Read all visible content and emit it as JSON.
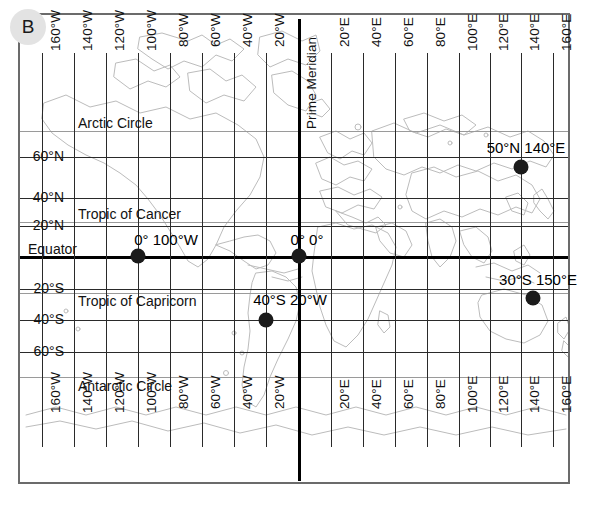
{
  "panel": {
    "badge_label": "B"
  },
  "map": {
    "projection_frame": {
      "left": 18,
      "top": 13,
      "width": 552,
      "height": 471
    },
    "longitude_labels": [
      {
        "label": "160°W",
        "x": 40
      },
      {
        "label": "140°W",
        "x": 72
      },
      {
        "label": "120°W",
        "x": 104
      },
      {
        "label": "100°W",
        "x": 136
      },
      {
        "label": "80°W",
        "x": 168
      },
      {
        "label": "60°W",
        "x": 200
      },
      {
        "label": "40°W",
        "x": 232
      },
      {
        "label": "20°W",
        "x": 264
      },
      {
        "label": "Prime Meridian",
        "x": 297,
        "emphasis": true
      },
      {
        "label": "20°E",
        "x": 329
      },
      {
        "label": "40°E",
        "x": 361
      },
      {
        "label": "60°E",
        "x": 393
      },
      {
        "label": "80°E",
        "x": 425
      },
      {
        "label": "100°E",
        "x": 457
      },
      {
        "label": "120°E",
        "x": 488
      },
      {
        "label": "140°E",
        "x": 519
      },
      {
        "label": "160°E",
        "x": 551
      }
    ],
    "bottom_longitude_labels": [
      {
        "label": "160°W",
        "x": 40
      },
      {
        "label": "140°W",
        "x": 72
      },
      {
        "label": "120°W",
        "x": 104
      },
      {
        "label": "100°W",
        "x": 136
      },
      {
        "label": "80°W",
        "x": 168
      },
      {
        "label": "60°W",
        "x": 200
      },
      {
        "label": "40°W",
        "x": 232
      },
      {
        "label": "20°W",
        "x": 264
      },
      {
        "label": "20°E",
        "x": 329
      },
      {
        "label": "40°E",
        "x": 361
      },
      {
        "label": "60°E",
        "x": 393
      },
      {
        "label": "80°E",
        "x": 425
      },
      {
        "label": "100°E",
        "x": 457
      },
      {
        "label": "120°E",
        "x": 488
      },
      {
        "label": "140°E",
        "x": 519
      },
      {
        "label": "160°E",
        "x": 551
      }
    ],
    "latitude_labels": [
      {
        "label": "60°N",
        "y": 155
      },
      {
        "label": "40°N",
        "y": 196
      },
      {
        "label": "20°N",
        "y": 224
      },
      {
        "label": "Equator",
        "y": 255,
        "emphasis": true
      },
      {
        "label": "20°S",
        "y": 287
      },
      {
        "label": "40°S",
        "y": 318
      },
      {
        "label": "60°S",
        "y": 350
      }
    ],
    "reference_lines": [
      {
        "label": "Arctic Circle",
        "y": 129,
        "color": "#9a9a9a"
      },
      {
        "label": "Tropic of Cancer",
        "y": 220,
        "color": "#9a9a9a"
      },
      {
        "label": "Tropic of Capricorn",
        "y": 291,
        "color": "#9a9a9a"
      },
      {
        "label": "Antarctic Circle",
        "y": 375,
        "color": "#9a9a9a"
      }
    ],
    "markers": [
      {
        "label": "0° 100°W",
        "x": 136,
        "y": 255,
        "label_x": 163,
        "label_y": 238
      },
      {
        "label": "0° 0°",
        "x": 297,
        "y": 255,
        "label_x": 302,
        "label_y": 238
      },
      {
        "label": "50°N 140°E",
        "x": 519,
        "y": 165,
        "label_x": 521,
        "label_y": 147
      },
      {
        "label": "40°S 20°W",
        "x": 264,
        "y": 318,
        "label_x": 285,
        "label_y": 297
      },
      {
        "label": "30°S 150°E",
        "x": 531,
        "y": 296,
        "label_x": 533,
        "label_y": 278
      }
    ],
    "colors": {
      "grid": "#2a2a2a",
      "emphasis_line": "#000000",
      "reference_line": "#9a9a9a",
      "coastline": "#b9b9b9",
      "frame": "#6b6b6b",
      "marker": "#1b1b1b",
      "badge_bg": "#e3e3e3"
    }
  }
}
